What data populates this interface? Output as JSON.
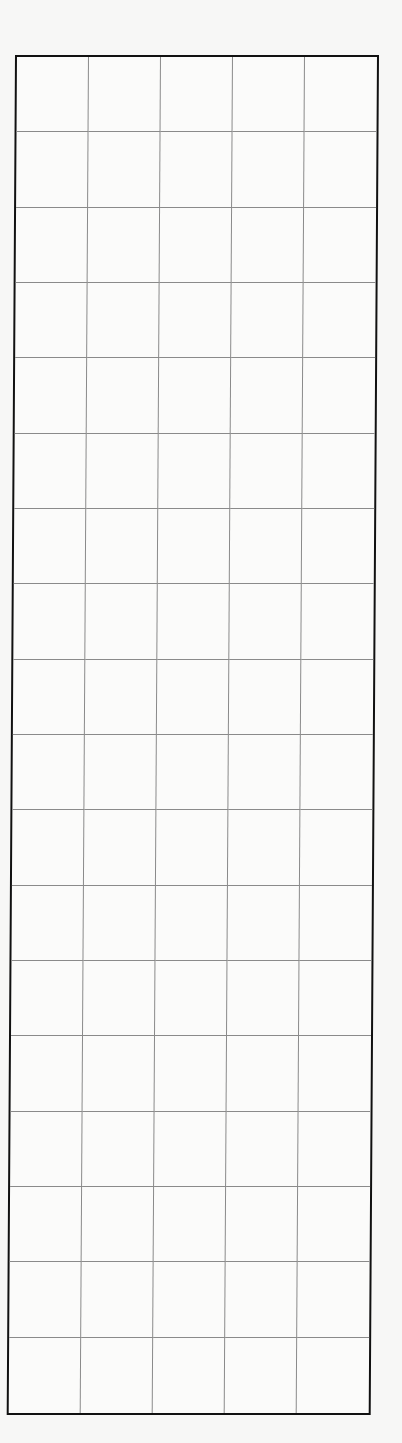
{
  "grid": {
    "columns": 5,
    "rows": 18,
    "border_color": "#111111",
    "line_color": "#8a8a8a",
    "background": "#fbfbfa",
    "cells_text": []
  }
}
